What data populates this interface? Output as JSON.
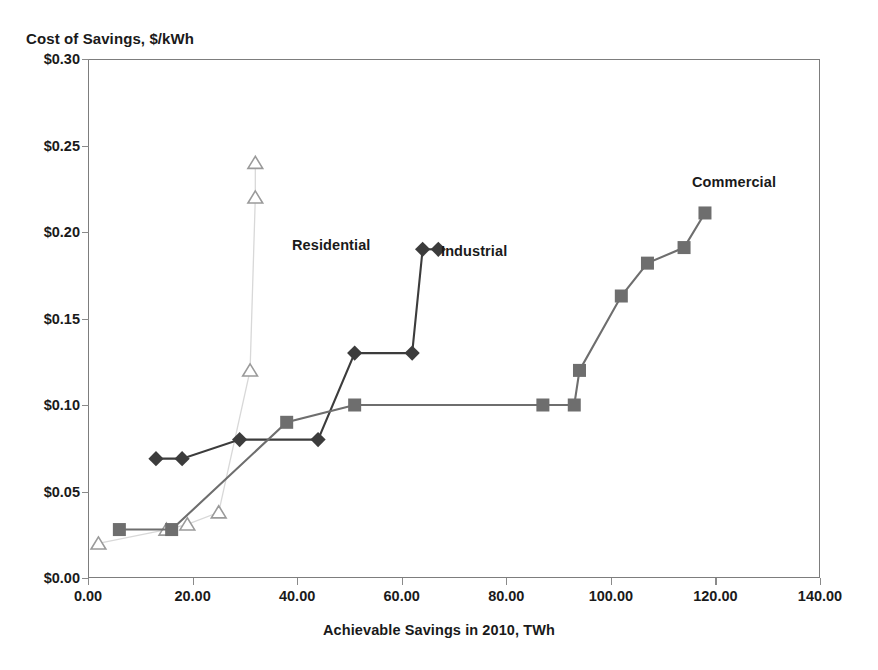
{
  "chart_data": {
    "type": "line",
    "title": "",
    "xlabel": "Achievable Savings in 2010, TWh",
    "ylabel": "Cost of Savings, $/kWh",
    "xlim": [
      0,
      140
    ],
    "ylim": [
      0,
      0.3
    ],
    "grid": false,
    "legend_position": "inline-annotations",
    "xticks": [
      "0.00",
      "20.00",
      "40.00",
      "60.00",
      "80.00",
      "100.00",
      "120.00",
      "140.00"
    ],
    "xtick_values": [
      0,
      20,
      40,
      60,
      80,
      100,
      120,
      140
    ],
    "yticks": [
      "$0.00",
      "$0.05",
      "$0.10",
      "$0.15",
      "$0.20",
      "$0.25",
      "$0.30"
    ],
    "ytick_values": [
      0,
      0.05,
      0.1,
      0.15,
      0.2,
      0.25,
      0.3
    ],
    "series": [
      {
        "name": "Residential",
        "marker": "open-triangle",
        "color": "#9a9a9a",
        "line_color": "#d8d8d8",
        "points": [
          {
            "x": 2,
            "y": 0.02
          },
          {
            "x": 15,
            "y": 0.028
          },
          {
            "x": 19,
            "y": 0.031
          },
          {
            "x": 25,
            "y": 0.038
          },
          {
            "x": 31,
            "y": 0.12
          },
          {
            "x": 32,
            "y": 0.22
          }
        ],
        "annotation": {
          "label": "Residential",
          "marker_x": 32,
          "marker_y": 0.24
        }
      },
      {
        "name": "Industrial",
        "marker": "filled-diamond",
        "color": "#3c3c3c",
        "line_color": "#3c3c3c",
        "points": [
          {
            "x": 13,
            "y": 0.069
          },
          {
            "x": 18,
            "y": 0.069
          },
          {
            "x": 29,
            "y": 0.08
          },
          {
            "x": 44,
            "y": 0.08
          },
          {
            "x": 51,
            "y": 0.13
          },
          {
            "x": 62,
            "y": 0.13
          },
          {
            "x": 64,
            "y": 0.19
          }
        ],
        "annotation": {
          "label": "Industrial",
          "marker_x": 67,
          "marker_y": 0.19
        }
      },
      {
        "name": "Commercial",
        "marker": "filled-square",
        "color": "#6e6e6e",
        "line_color": "#6e6e6e",
        "points": [
          {
            "x": 6,
            "y": 0.028
          },
          {
            "x": 16,
            "y": 0.028
          },
          {
            "x": 38,
            "y": 0.09
          },
          {
            "x": 51,
            "y": 0.1
          },
          {
            "x": 87,
            "y": 0.1
          },
          {
            "x": 93,
            "y": 0.1
          },
          {
            "x": 94,
            "y": 0.12
          },
          {
            "x": 102,
            "y": 0.163
          },
          {
            "x": 107,
            "y": 0.182
          },
          {
            "x": 114,
            "y": 0.191
          },
          {
            "x": 118,
            "y": 0.211
          }
        ],
        "annotation": {
          "label": "Commercial",
          "marker_x": null,
          "marker_y": null
        }
      }
    ]
  },
  "axes": {
    "y_title": "Cost of Savings, $/kWh",
    "x_title": "Achievable Savings in 2010, TWh"
  },
  "annotations": {
    "residential": "Residential",
    "industrial": "Industrial",
    "commercial": "Commercial"
  },
  "colors": {
    "frame": "#7d7d7d",
    "residential": "#9a9a9a",
    "industrial": "#3c3c3c",
    "commercial": "#6e6e6e",
    "text": "#1a1a1a",
    "background": "#ffffff"
  }
}
